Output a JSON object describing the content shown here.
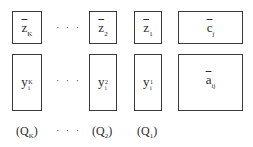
{
  "top_row": [
    {
      "base": "z",
      "sub": "K"
    },
    {
      "base": "z",
      "sub": "2"
    },
    {
      "base": "z",
      "sub": "1"
    },
    {
      "base": "c",
      "sub": "j"
    }
  ],
  "bottom_row": [
    {
      "base": "y",
      "sup": "K",
      "sub": "i"
    },
    {
      "base": "y",
      "sup": "2",
      "sub": "i"
    },
    {
      "base": "y",
      "sup": "1",
      "sub": "i"
    },
    {
      "base": "a",
      "sub": "ij"
    }
  ],
  "labels": [
    {
      "open": "(Q",
      "sub": "K",
      "close": ")"
    },
    {
      "open": "(Q",
      "sub": "2",
      "close": ")"
    },
    {
      "open": "(Q",
      "sub": "1",
      "close": ")"
    }
  ],
  "ellipsis": "· · ·"
}
